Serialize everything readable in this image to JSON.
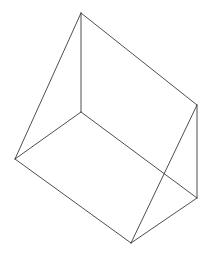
{
  "figure": {
    "shape_type": "triangular-prism",
    "canvas": {
      "width": 209,
      "height": 256,
      "background": "#ffffff"
    },
    "style": {
      "stroke_color": "#3a3a3a",
      "stroke_width": 0.9,
      "fill": "none"
    },
    "vertices": [
      {
        "id": "apex-top",
        "label": "A",
        "x": 81,
        "y": 13
      },
      {
        "id": "center",
        "label": "B",
        "x": 81,
        "y": 112
      },
      {
        "id": "left",
        "label": "C",
        "x": 15,
        "y": 159
      },
      {
        "id": "bottom",
        "label": "D",
        "x": 131,
        "y": 243
      },
      {
        "id": "right-upper",
        "label": "E",
        "x": 197,
        "y": 105
      },
      {
        "id": "right-lower",
        "label": "F",
        "x": 197,
        "y": 198
      }
    ],
    "edges": [
      {
        "id": "edge-apex-left",
        "from": "apex-top",
        "to": "left",
        "x1": 81,
        "y1": 13,
        "x2": 15,
        "y2": 159
      },
      {
        "id": "edge-apex-center",
        "from": "apex-top",
        "to": "center",
        "x1": 81,
        "y1": 13,
        "x2": 81,
        "y2": 112
      },
      {
        "id": "edge-apex-right-upper",
        "from": "apex-top",
        "to": "right-upper",
        "x1": 81,
        "y1": 13,
        "x2": 197,
        "y2": 105
      },
      {
        "id": "edge-center-left",
        "from": "center",
        "to": "left",
        "x1": 81,
        "y1": 112,
        "x2": 15,
        "y2": 159
      },
      {
        "id": "edge-center-right-lower",
        "from": "center",
        "to": "right-lower",
        "x1": 81,
        "y1": 112,
        "x2": 197,
        "y2": 198
      },
      {
        "id": "edge-left-bottom",
        "from": "left",
        "to": "bottom",
        "x1": 15,
        "y1": 159,
        "x2": 131,
        "y2": 243
      },
      {
        "id": "edge-bottom-right-upper",
        "from": "bottom",
        "to": "right-upper",
        "x1": 131,
        "y1": 243,
        "x2": 197,
        "y2": 105
      },
      {
        "id": "edge-bottom-right-lower",
        "from": "bottom",
        "to": "right-lower",
        "x1": 131,
        "y1": 243,
        "x2": 197,
        "y2": 198
      },
      {
        "id": "edge-right-vertical",
        "from": "right-upper",
        "to": "right-lower",
        "x1": 197,
        "y1": 105,
        "x2": 197,
        "y2": 198
      }
    ],
    "intersections": [
      {
        "id": "crossing-center-right",
        "x": 165,
        "y": 173,
        "between": [
          "edge-center-right-lower",
          "edge-bottom-right-upper"
        ]
      }
    ]
  }
}
